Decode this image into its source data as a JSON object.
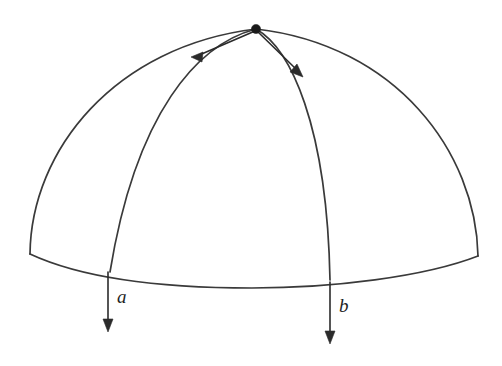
{
  "figure": {
    "kind": "geometry-diagram",
    "background_color": "#ffffff",
    "line_color": "#3a3a3a",
    "arrow_color": "#2b2b2b",
    "dot_color": "#1a1a1a"
  },
  "labels": {
    "a": "a",
    "b": "b"
  },
  "points": {
    "apex": {
      "x": 256,
      "y": 29
    },
    "left_base": {
      "x": 30,
      "y": 254
    },
    "right_base": {
      "x": 478,
      "y": 256
    },
    "bottom_arc_low": {
      "x": 252,
      "y": 288
    },
    "left_meridian_end": {
      "x": 110,
      "y": 272
    },
    "right_meridian_end": {
      "x": 330,
      "y": 280
    }
  },
  "tangent_arrows": [
    {
      "name": "left-tangent",
      "from": {
        "x": 256,
        "y": 29
      },
      "to": {
        "x": 192,
        "y": 57
      }
    },
    {
      "name": "right-tangent",
      "from": {
        "x": 256,
        "y": 29
      },
      "to": {
        "x": 302,
        "y": 76
      }
    }
  ],
  "down_arrows": [
    {
      "name": "arrow-a",
      "label": "a",
      "x": 108,
      "y_start": 272,
      "y_end": 331,
      "label_x": 121,
      "label_y": 302
    },
    {
      "name": "arrow-b",
      "label": "b",
      "x": 330,
      "y_start": 282,
      "y_end": 343,
      "label_x": 343,
      "label_y": 311
    }
  ]
}
